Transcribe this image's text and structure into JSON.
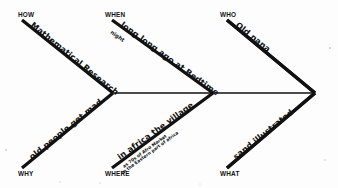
{
  "diagram": {
    "kind": "fishbone-ishikawa-diagram",
    "style": "hand-drawn marker on white paper",
    "background_color": "#fdfdfd",
    "ink_color": "#111111",
    "spine": {
      "label": "central-spine",
      "start_x": 113,
      "start_y": 93,
      "end_x": 315,
      "end_y": 93
    },
    "arrowhead": {
      "label": "right-arrow-point",
      "tip_x": 315,
      "tip_y": 93
    },
    "branches": [
      {
        "id": "how",
        "category": "HOW",
        "position": "top-left",
        "category_x": 18,
        "category_y": 17,
        "note": "Mathematical Research",
        "note_rotation": 32,
        "note_x": 30,
        "note_y": 26,
        "sub_note": "",
        "line": {
          "x1": 22,
          "y1": 20,
          "x2": 113,
          "y2": 93
        }
      },
      {
        "id": "when",
        "category": "WHEN",
        "position": "top-middle",
        "category_x": 105,
        "category_y": 17,
        "note": "long long ago at Bedtime",
        "note_rotation": 32,
        "note_x": 118,
        "note_y": 26,
        "sub_note": "night",
        "sub_note_x": 111,
        "sub_note_y": 36,
        "line": {
          "x1": 112,
          "y1": 20,
          "x2": 213,
          "y2": 93
        }
      },
      {
        "id": "who",
        "category": "WHO",
        "position": "top-right",
        "category_x": 220,
        "category_y": 17,
        "note": "Old nana",
        "note_rotation": 32,
        "note_x": 233,
        "note_y": 26,
        "sub_note": "",
        "line": {
          "x1": 227,
          "y1": 20,
          "x2": 315,
          "y2": 93
        }
      },
      {
        "id": "why",
        "category": "WHY",
        "position": "bottom-left",
        "category_x": 18,
        "category_y": 176,
        "note": "old people get mad",
        "note_rotation": -39,
        "note_x": 30,
        "note_y": 158,
        "sub_note": "",
        "line": {
          "x1": 22,
          "y1": 168,
          "x2": 113,
          "y2": 93
        }
      },
      {
        "id": "where",
        "category": "WHERE",
        "position": "bottom-middle",
        "category_x": 105,
        "category_y": 176,
        "note": "in africa the village",
        "note_rotation": -39,
        "note_x": 118,
        "note_y": 158,
        "sub_note": "as 70s of Afro Market",
        "sub_note2": "in the Eastern part of africa",
        "sub_note_x": 120,
        "sub_note_y": 168,
        "line": {
          "x1": 112,
          "y1": 168,
          "x2": 213,
          "y2": 93
        }
      },
      {
        "id": "what",
        "category": "WHAT",
        "position": "bottom-right",
        "category_x": 220,
        "category_y": 176,
        "note": "sand illustrated",
        "note_rotation": -39,
        "note_x": 233,
        "note_y": 158,
        "sub_note": "",
        "line": {
          "x1": 227,
          "y1": 168,
          "x2": 315,
          "y2": 93
        }
      }
    ]
  }
}
